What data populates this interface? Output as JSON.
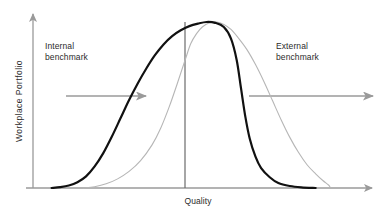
{
  "figure": {
    "width": 384,
    "height": 216,
    "background": "#ffffff"
  },
  "axes": {
    "y_title": "Workplace  Portfolio",
    "x_title": "Quality",
    "axis_color": "#9a9a9a",
    "origin_x": 33,
    "baseline_y": 188,
    "y_top": 12,
    "x_right": 374
  },
  "annotations": {
    "internal": {
      "label": "Internal\nbenchmark",
      "arrow_color": "#9a9a9a",
      "arrow_x_start": 66,
      "arrow_x_end": 148,
      "arrow_y": 96
    },
    "external": {
      "label": "External\nbenchmark",
      "arrow_color": "#9a9a9a",
      "arrow_x_start": 249,
      "arrow_x_end": 375,
      "arrow_y": 96
    },
    "center_line": {
      "name": "target-quality-line",
      "color": "#6b6b6b",
      "x": 185,
      "y_top": 22,
      "y_bottom": 188
    }
  },
  "chart_data": {
    "type": "line",
    "title": "",
    "subtitle": "",
    "xlabel": "Quality",
    "ylabel": "Workplace  Portfolio",
    "xlim": [
      0,
      1
    ],
    "ylim": [
      0,
      1
    ],
    "grid": false,
    "legend_position": "none",
    "axis_ticks": {
      "x": [],
      "y": []
    },
    "annotations": [
      {
        "text": "Internal benchmark",
        "x": 0.1,
        "y": 0.82
      },
      {
        "text": "External benchmark",
        "x": 0.73,
        "y": 0.82
      },
      {
        "text": "Quality",
        "x": 0.45,
        "y": -0.06
      }
    ],
    "series": [
      {
        "name": "current-portfolio-distribution",
        "style": "solid-bold-black",
        "color": "#111111",
        "width": 2.2,
        "description": "Broad left-skewed bell curve, peaks at target quality, long left tail.",
        "points": [
          [
            0.03,
            0.0
          ],
          [
            0.06,
            0.005
          ],
          [
            0.09,
            0.015
          ],
          [
            0.12,
            0.035
          ],
          [
            0.15,
            0.07
          ],
          [
            0.18,
            0.13
          ],
          [
            0.21,
            0.21
          ],
          [
            0.24,
            0.31
          ],
          [
            0.27,
            0.42
          ],
          [
            0.3,
            0.53
          ],
          [
            0.33,
            0.63
          ],
          [
            0.36,
            0.72
          ],
          [
            0.39,
            0.8
          ],
          [
            0.42,
            0.865
          ],
          [
            0.45,
            0.915
          ],
          [
            0.48,
            0.95
          ],
          [
            0.51,
            0.975
          ],
          [
            0.54,
            0.99
          ],
          [
            0.57,
            1.0
          ],
          [
            0.6,
            0.995
          ],
          [
            0.63,
            0.97
          ],
          [
            0.655,
            0.9
          ],
          [
            0.675,
            0.77
          ],
          [
            0.69,
            0.6
          ],
          [
            0.705,
            0.43
          ],
          [
            0.72,
            0.3
          ],
          [
            0.74,
            0.19
          ],
          [
            0.76,
            0.12
          ],
          [
            0.79,
            0.065
          ],
          [
            0.82,
            0.03
          ],
          [
            0.86,
            0.012
          ],
          [
            0.9,
            0.004
          ],
          [
            0.95,
            0.0
          ]
        ]
      },
      {
        "name": "benchmark-distribution",
        "style": "fine-light-grey",
        "color": "#b6b6b6",
        "width": 1.1,
        "description": "Narrower, right-shifted bell curve with steep left flank and long right tail.",
        "points": [
          [
            0.14,
            0.0
          ],
          [
            0.18,
            0.008
          ],
          [
            0.22,
            0.025
          ],
          [
            0.26,
            0.055
          ],
          [
            0.3,
            0.1
          ],
          [
            0.34,
            0.165
          ],
          [
            0.38,
            0.26
          ],
          [
            0.41,
            0.36
          ],
          [
            0.44,
            0.49
          ],
          [
            0.47,
            0.64
          ],
          [
            0.495,
            0.77
          ],
          [
            0.515,
            0.87
          ],
          [
            0.535,
            0.93
          ],
          [
            0.555,
            0.97
          ],
          [
            0.58,
            0.995
          ],
          [
            0.605,
            1.0
          ],
          [
            0.63,
            0.985
          ],
          [
            0.655,
            0.955
          ],
          [
            0.68,
            0.905
          ],
          [
            0.71,
            0.835
          ],
          [
            0.74,
            0.745
          ],
          [
            0.77,
            0.64
          ],
          [
            0.8,
            0.525
          ],
          [
            0.83,
            0.41
          ],
          [
            0.86,
            0.305
          ],
          [
            0.89,
            0.215
          ],
          [
            0.92,
            0.14
          ],
          [
            0.95,
            0.085
          ],
          [
            0.975,
            0.045
          ],
          [
            0.995,
            0.018
          ],
          [
            1.0,
            0.005
          ]
        ]
      }
    ]
  }
}
